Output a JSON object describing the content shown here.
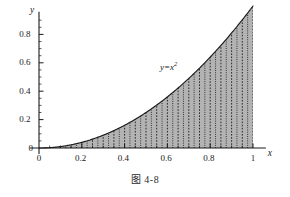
{
  "figure": {
    "caption": "图 4-8",
    "curve_label_base": "y=x",
    "curve_label_exponent": "2",
    "x_axis_name": "x",
    "y_axis_name": "y"
  },
  "chart_data": {
    "type": "area",
    "title": "",
    "subtitle": "",
    "xlabel": "x",
    "ylabel": "y",
    "function": "y = x^2",
    "annotations": [
      "y=x²"
    ],
    "grid": false,
    "legend_position": "none",
    "xlim": [
      0,
      1.06
    ],
    "ylim": [
      0,
      0.96
    ],
    "x_ticks": [
      0,
      0.2,
      0.4,
      0.6,
      0.8,
      1
    ],
    "x_tick_labels": [
      "0",
      "0.2",
      "0.4",
      "0.6",
      "0.8",
      "1"
    ],
    "y_ticks": [
      0,
      0.2,
      0.4,
      0.6,
      0.8
    ],
    "y_tick_labels": [
      "0",
      "0.2",
      "0.4",
      "0.6",
      "0.8"
    ],
    "x_minor_tick_step": 0.05,
    "y_minor_tick_step": 0.05,
    "fill_color": "#b3b3b3",
    "curve_color": "#1a1a1a",
    "partition_color": "#111111",
    "partition_count": 40,
    "x": [
      0,
      0.05,
      0.1,
      0.15,
      0.2,
      0.25,
      0.3,
      0.35,
      0.4,
      0.45,
      0.5,
      0.55,
      0.6,
      0.65,
      0.7,
      0.75,
      0.8,
      0.85,
      0.9,
      0.95,
      1
    ],
    "y": [
      0,
      0.0025,
      0.01,
      0.0225,
      0.04,
      0.0625,
      0.09,
      0.1225,
      0.16,
      0.2025,
      0.25,
      0.3025,
      0.36,
      0.4225,
      0.49,
      0.5625,
      0.64,
      0.7225,
      0.81,
      0.9025,
      1
    ]
  },
  "geometry": {
    "origin_x": 39,
    "origin_y": 148,
    "x_scale": 214,
    "y_scale": 142
  }
}
